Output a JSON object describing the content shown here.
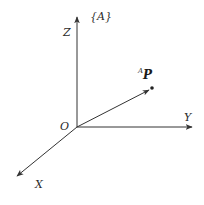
{
  "diagram": {
    "frame_label": "{A}",
    "origin_label": "O",
    "axes": [
      {
        "name": "Z",
        "label": "Z",
        "from": [
          77,
          127
        ],
        "to": [
          77,
          15
        ]
      },
      {
        "name": "Y",
        "label": "Y",
        "from": [
          77,
          127
        ],
        "to": [
          193,
          127
        ]
      },
      {
        "name": "X",
        "label": "X",
        "from": [
          77,
          127
        ],
        "to": [
          16,
          177
        ]
      }
    ],
    "vector": {
      "superscript": "A",
      "label": "P",
      "from": [
        77,
        127
      ],
      "to": [
        152,
        88
      ]
    },
    "colors": {
      "stroke": "#333333",
      "background": "#ffffff"
    }
  }
}
